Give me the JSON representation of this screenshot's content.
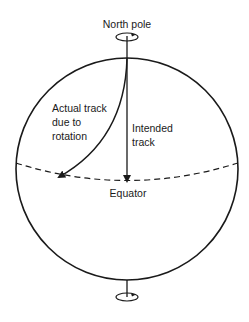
{
  "diagram": {
    "labels": {
      "north_pole": "North pole",
      "actual_track_line1": "Actual track",
      "actual_track_line2": "due to",
      "actual_track_line3": "rotation",
      "intended_track_line1": "Intended",
      "intended_track_line2": "track",
      "equator": "Equator"
    },
    "colors": {
      "stroke": "#1a1a1a",
      "background": "#ffffff"
    }
  }
}
